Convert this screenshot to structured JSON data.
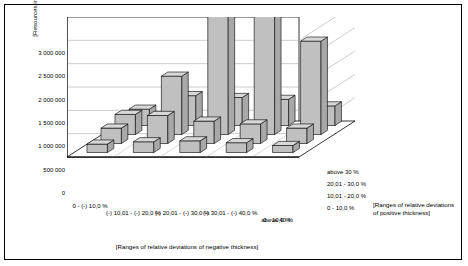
{
  "chart_data": {
    "type": "bar",
    "title": "",
    "subtitle": "",
    "ylabel": "[Resources in a thousands ton]",
    "xlabel": "[Ranges of relative deviations of negative thickness]",
    "zlabel": "[Ranges of relative deviations of positive thickness]",
    "ylim": [
      0,
      3000000
    ],
    "yticks": [
      "0",
      "500 000",
      "1 000 000",
      "1 500 000",
      "2 000 000",
      "2 500 000",
      "3 000 000"
    ],
    "ytick_values": [
      0,
      500000,
      1000000,
      1500000,
      2000000,
      2500000,
      3000000
    ],
    "grid": true,
    "legend_position": "none",
    "categories": [
      "0 - (-) 10,0 %",
      "(-) 10,01 - (-) 20,0 %",
      "(-) 20,01 - (-) 30,0 %",
      "(-) 30,01 - (-) 40,0 %",
      "above 40 %"
    ],
    "series": [
      {
        "name": "0 - 10,0 %",
        "values": [
          180000,
          230000,
          250000,
          210000,
          150000
        ]
      },
      {
        "name": "10,01 - 20,0 %",
        "values": [
          330000,
          600000,
          480000,
          420000,
          330000
        ]
      },
      {
        "name": "20,01 - 30,0 %",
        "values": [
          430000,
          1250000,
          2980000,
          3000000,
          2000000
        ]
      },
      {
        "name": "above 30 %",
        "values": [
          350000,
          640000,
          600000,
          560000,
          420000
        ]
      }
    ],
    "bar_fill": "#c0c0c0",
    "bar_side_fill": "#a8a8a8",
    "bar_top_fill": "#d8d8d8",
    "bar_stroke": "#000000",
    "panel_fill": "#ffffff",
    "grid_color": "#808080",
    "wall_color": "#000000"
  }
}
